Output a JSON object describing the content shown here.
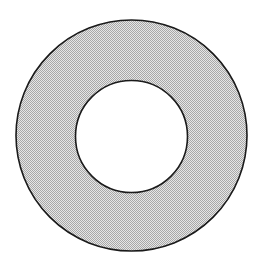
{
  "diagram": {
    "type": "annulus",
    "outer_circle": {
      "cx": 131.5,
      "cy": 135.5,
      "r": 115.5
    },
    "inner_circle": {
      "cx": 131.5,
      "cy": 136.5,
      "r": 56
    },
    "colors": {
      "stroke": "#1a1a1a",
      "fill_dark": "#a8a8a8",
      "fill_light": "#e6e6e6",
      "hole": "#ffffff",
      "background": "#ffffff"
    },
    "fill_style": "dithered-gray"
  }
}
